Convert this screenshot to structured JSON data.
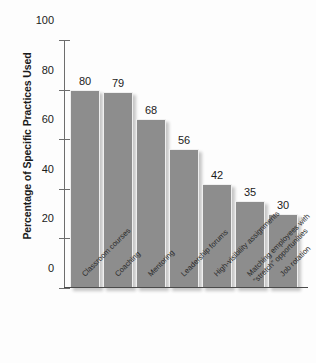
{
  "chart_data": {
    "type": "bar",
    "title": "",
    "xlabel": "",
    "ylabel": "Percentage of Specific Practices Used",
    "ylim": [
      0,
      100
    ],
    "yticks": [
      0,
      20,
      40,
      60,
      80,
      100
    ],
    "grid": false,
    "legend": "none",
    "bar_color": "#8d8d8d",
    "categories": [
      "Classroom courses",
      "Coaching",
      "Mentoring",
      "Leadership forums",
      "High-visibility assignments",
      "Matching employees with \"stretch\" opportunities",
      "Job rotation"
    ],
    "category_lines": [
      [
        "Classroom courses"
      ],
      [
        "Coaching"
      ],
      [
        "Mentoring"
      ],
      [
        "Leadership forums"
      ],
      [
        "High-visibility assignments"
      ],
      [
        "Matching employees with",
        "“stretch” opportunities"
      ],
      [
        "Job rotation"
      ]
    ],
    "values": [
      80,
      79,
      68,
      56,
      42,
      35,
      30
    ],
    "value_labels": [
      "80",
      "79",
      "68",
      "56",
      "42",
      "35",
      "30"
    ],
    "ytick_labels": [
      "0",
      "20",
      "40",
      "60",
      "80",
      "100"
    ]
  }
}
